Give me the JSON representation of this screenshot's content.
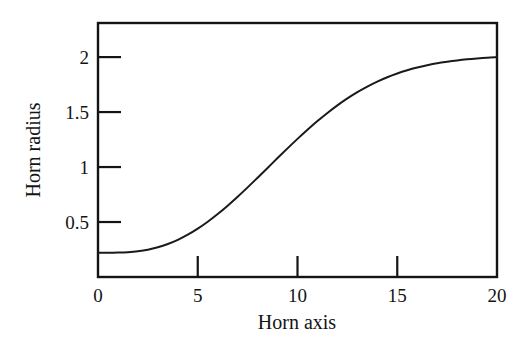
{
  "chart_data": {
    "type": "line",
    "title": "",
    "subtitle": "",
    "xlabel": "Horn axis",
    "ylabel": "Horn radius",
    "xlim": [
      0,
      20
    ],
    "ylim": [
      0,
      2.31
    ],
    "xticks": [
      0,
      5,
      10,
      15,
      20
    ],
    "xtick_labels": [
      "0",
      "5",
      "10",
      "15",
      "20"
    ],
    "yticks": [
      0.5,
      1,
      1.5,
      2
    ],
    "ytick_labels": [
      "0.5",
      "1",
      "1.5",
      "2"
    ],
    "grid": false,
    "legend": null,
    "annotations": [],
    "series": [
      {
        "name": "Horn profile",
        "color": "#1a1a1a",
        "line_width": 2,
        "x": [
          0,
          0.5,
          1,
          1.5,
          2,
          2.5,
          3,
          3.5,
          4,
          4.5,
          5,
          5.5,
          6,
          6.5,
          7,
          7.5,
          8,
          8.5,
          9,
          9.5,
          10,
          10.5,
          11,
          11.5,
          12,
          12.5,
          13,
          13.5,
          14,
          14.5,
          15,
          15.5,
          16,
          16.5,
          17,
          17.5,
          18,
          18.5,
          19,
          19.5,
          20
        ],
        "values": [
          0.22,
          0.22,
          0.222,
          0.226,
          0.234,
          0.248,
          0.27,
          0.3,
          0.338,
          0.385,
          0.44,
          0.503,
          0.573,
          0.649,
          0.73,
          0.815,
          0.903,
          0.992,
          1.082,
          1.17,
          1.256,
          1.339,
          1.418,
          1.492,
          1.561,
          1.624,
          1.681,
          1.732,
          1.777,
          1.817,
          1.851,
          1.88,
          1.905,
          1.926,
          1.944,
          1.958,
          1.97,
          1.98,
          1.988,
          1.995,
          2.0
        ]
      }
    ]
  },
  "axes": {
    "frame_color": "#141414",
    "frame_width": 2,
    "tick_direction": "in"
  }
}
